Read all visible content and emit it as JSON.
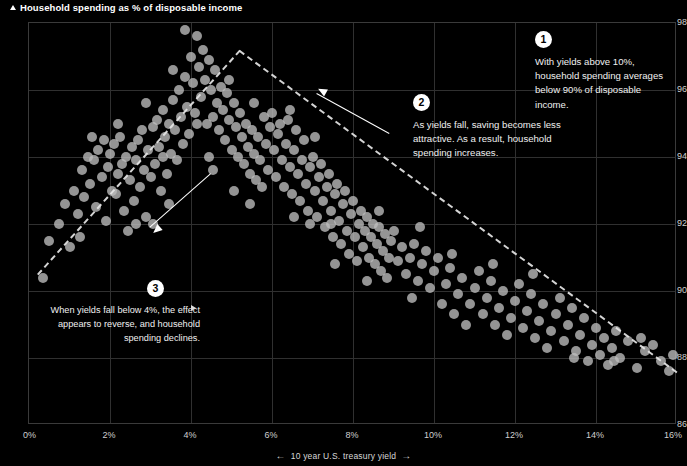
{
  "title": {
    "text": "Household spending as % of disposable income",
    "marker_icon": "up-arrow-icon"
  },
  "axis": {
    "y": {
      "label": "Household spending as % of disposable income",
      "ticks": [
        "98",
        "96",
        "94",
        "92",
        "90",
        "88",
        "86"
      ],
      "min": 86,
      "max": 98,
      "step": 2
    },
    "x": {
      "label": "10 year U.S. treasury yield",
      "ticks": [
        "0%",
        "2%",
        "4%",
        "6%",
        "8%",
        "10%",
        "12%",
        "14%",
        "16%"
      ],
      "min": 0,
      "max": 16,
      "step": 2,
      "left_arrow": "←",
      "right_arrow": "→"
    }
  },
  "annotations": [
    {
      "number": "1",
      "text": "With yields above 10%, household spending averages below 90% of disposable income."
    },
    {
      "number": "2",
      "text": "As yields fall, saving becomes less attractive. As a result, household spending increases."
    },
    {
      "number": "3",
      "text": "When yields fall below 4%, the effect appears to reverse, and household spending declines."
    }
  ],
  "colors": {
    "background": "#000000",
    "point": "#bebebe",
    "grid": "#303030",
    "text": "#e8e8e8",
    "accent": "#ffffff"
  },
  "chart_data": {
    "type": "scatter",
    "title": "Household spending as % of disposable income",
    "xlabel": "10 year U.S. treasury yield",
    "ylabel": "Household spending as % of disposable income",
    "xlim": [
      0,
      16
    ],
    "ylim": [
      86,
      98
    ],
    "xticks": [
      0,
      2,
      4,
      6,
      8,
      10,
      12,
      14,
      16
    ],
    "yticks": [
      86,
      88,
      90,
      92,
      94,
      96,
      98
    ],
    "grid": true,
    "legend": "none",
    "x_unit": "%",
    "y_unit": "%",
    "points": [
      [
        0.35,
        90.4
      ],
      [
        0.75,
        92.0
      ],
      [
        0.9,
        92.6
      ],
      [
        1.0,
        91.3
      ],
      [
        1.1,
        93.0
      ],
      [
        1.2,
        92.3
      ],
      [
        1.3,
        93.6
      ],
      [
        1.35,
        92.8
      ],
      [
        1.45,
        94.0
      ],
      [
        1.5,
        93.2
      ],
      [
        1.6,
        93.9
      ],
      [
        1.65,
        92.5
      ],
      [
        1.7,
        94.2
      ],
      [
        1.8,
        93.4
      ],
      [
        1.85,
        94.5
      ],
      [
        1.9,
        92.1
      ],
      [
        1.95,
        93.7
      ],
      [
        2.0,
        94.1
      ],
      [
        2.05,
        93.0
      ],
      [
        2.1,
        94.4
      ],
      [
        2.15,
        92.9
      ],
      [
        2.2,
        93.5
      ],
      [
        2.25,
        94.6
      ],
      [
        2.3,
        93.8
      ],
      [
        2.35,
        92.4
      ],
      [
        2.4,
        94.0
      ],
      [
        2.5,
        93.3
      ],
      [
        2.55,
        94.3
      ],
      [
        2.6,
        92.7
      ],
      [
        2.65,
        93.9
      ],
      [
        2.7,
        94.5
      ],
      [
        2.75,
        93.1
      ],
      [
        2.8,
        94.8
      ],
      [
        2.85,
        93.6
      ],
      [
        2.9,
        92.2
      ],
      [
        2.95,
        94.2
      ],
      [
        3.0,
        93.4
      ],
      [
        3.05,
        94.9
      ],
      [
        3.1,
        93.8
      ],
      [
        3.15,
        95.1
      ],
      [
        3.2,
        94.3
      ],
      [
        3.25,
        93.0
      ],
      [
        3.3,
        95.4
      ],
      [
        3.35,
        94.6
      ],
      [
        3.4,
        93.5
      ],
      [
        3.45,
        95.0
      ],
      [
        3.5,
        94.1
      ],
      [
        3.55,
        95.7
      ],
      [
        3.6,
        94.8
      ],
      [
        3.65,
        93.9
      ],
      [
        3.7,
        96.0
      ],
      [
        3.75,
        95.2
      ],
      [
        3.8,
        94.4
      ],
      [
        3.85,
        96.4
      ],
      [
        3.9,
        95.5
      ],
      [
        3.95,
        94.7
      ],
      [
        4.0,
        97.0
      ],
      [
        4.05,
        96.2
      ],
      [
        4.1,
        95.3
      ],
      [
        4.15,
        97.6
      ],
      [
        4.2,
        96.7
      ],
      [
        4.25,
        95.8
      ],
      [
        4.3,
        97.2
      ],
      [
        4.35,
        96.3
      ],
      [
        4.4,
        95.0
      ],
      [
        4.45,
        96.9
      ],
      [
        4.5,
        96.0
      ],
      [
        4.55,
        95.2
      ],
      [
        4.6,
        96.6
      ],
      [
        4.65,
        95.6
      ],
      [
        4.7,
        94.8
      ],
      [
        4.75,
        96.1
      ],
      [
        4.8,
        95.4
      ],
      [
        4.85,
        94.5
      ],
      [
        4.9,
        95.9
      ],
      [
        4.95,
        95.1
      ],
      [
        5.0,
        94.2
      ],
      [
        5.05,
        95.6
      ],
      [
        5.1,
        94.9
      ],
      [
        5.15,
        94.0
      ],
      [
        5.2,
        95.3
      ],
      [
        5.25,
        94.6
      ],
      [
        5.3,
        93.8
      ],
      [
        5.35,
        95.0
      ],
      [
        5.4,
        94.3
      ],
      [
        5.45,
        93.5
      ],
      [
        5.5,
        94.8
      ],
      [
        5.55,
        94.1
      ],
      [
        5.6,
        93.3
      ],
      [
        5.65,
        94.6
      ],
      [
        5.7,
        93.9
      ],
      [
        5.75,
        93.1
      ],
      [
        5.8,
        95.2
      ],
      [
        5.85,
        94.4
      ],
      [
        5.9,
        93.6
      ],
      [
        5.95,
        94.9
      ],
      [
        6.0,
        95.3
      ],
      [
        6.05,
        94.2
      ],
      [
        6.1,
        93.4
      ],
      [
        6.15,
        94.7
      ],
      [
        6.2,
        95.0
      ],
      [
        6.25,
        93.9
      ],
      [
        6.3,
        93.1
      ],
      [
        6.35,
        94.4
      ],
      [
        6.4,
        95.1
      ],
      [
        6.45,
        93.7
      ],
      [
        6.5,
        92.9
      ],
      [
        6.55,
        94.2
      ],
      [
        6.6,
        94.8
      ],
      [
        6.65,
        93.5
      ],
      [
        6.7,
        92.7
      ],
      [
        6.75,
        93.9
      ],
      [
        6.8,
        94.5
      ],
      [
        6.85,
        93.2
      ],
      [
        6.9,
        92.4
      ],
      [
        6.95,
        93.7
      ],
      [
        7.0,
        94.0
      ],
      [
        7.05,
        93.0
      ],
      [
        7.1,
        92.2
      ],
      [
        7.15,
        93.4
      ],
      [
        7.2,
        93.8
      ],
      [
        7.25,
        92.7
      ],
      [
        7.3,
        91.9
      ],
      [
        7.35,
        93.1
      ],
      [
        7.4,
        93.5
      ],
      [
        7.45,
        92.4
      ],
      [
        7.5,
        91.6
      ],
      [
        7.55,
        92.9
      ],
      [
        7.6,
        93.2
      ],
      [
        7.65,
        92.1
      ],
      [
        7.7,
        91.4
      ],
      [
        7.75,
        92.6
      ],
      [
        7.8,
        93.0
      ],
      [
        7.85,
        91.8
      ],
      [
        7.9,
        91.1
      ],
      [
        7.95,
        92.3
      ],
      [
        8.0,
        92.7
      ],
      [
        8.05,
        91.6
      ],
      [
        8.1,
        90.9
      ],
      [
        8.15,
        92.0
      ],
      [
        8.2,
        92.4
      ],
      [
        8.25,
        91.3
      ],
      [
        8.3,
        91.8
      ],
      [
        8.35,
        92.2
      ],
      [
        8.4,
        91.0
      ],
      [
        8.45,
        91.6
      ],
      [
        8.5,
        92.0
      ],
      [
        8.55,
        90.8
      ],
      [
        8.6,
        91.4
      ],
      [
        8.65,
        91.9
      ],
      [
        8.7,
        90.6
      ],
      [
        8.75,
        91.2
      ],
      [
        8.8,
        91.7
      ],
      [
        8.85,
        90.4
      ],
      [
        8.9,
        91.0
      ],
      [
        8.95,
        91.5
      ],
      [
        9.0,
        91.8
      ],
      [
        9.1,
        90.9
      ],
      [
        9.2,
        91.3
      ],
      [
        9.3,
        90.5
      ],
      [
        9.4,
        91.0
      ],
      [
        9.5,
        91.4
      ],
      [
        9.6,
        90.3
      ],
      [
        9.7,
        90.8
      ],
      [
        9.8,
        91.2
      ],
      [
        9.9,
        90.1
      ],
      [
        10.0,
        90.6
      ],
      [
        10.1,
        91.0
      ],
      [
        10.2,
        89.6
      ],
      [
        10.3,
        90.2
      ],
      [
        10.4,
        90.7
      ],
      [
        10.5,
        89.3
      ],
      [
        10.6,
        89.9
      ],
      [
        10.7,
        90.4
      ],
      [
        10.8,
        89.0
      ],
      [
        10.9,
        89.6
      ],
      [
        11.0,
        90.1
      ],
      [
        11.1,
        90.6
      ],
      [
        11.2,
        89.3
      ],
      [
        11.3,
        89.8
      ],
      [
        11.4,
        90.3
      ],
      [
        11.5,
        89.0
      ],
      [
        11.6,
        89.5
      ],
      [
        11.7,
        90.0
      ],
      [
        11.8,
        88.7
      ],
      [
        11.9,
        89.2
      ],
      [
        12.0,
        89.7
      ],
      [
        12.1,
        90.2
      ],
      [
        12.2,
        88.9
      ],
      [
        12.3,
        89.4
      ],
      [
        12.4,
        89.9
      ],
      [
        12.5,
        88.6
      ],
      [
        12.6,
        89.1
      ],
      [
        12.7,
        89.6
      ],
      [
        12.8,
        88.3
      ],
      [
        12.9,
        88.8
      ],
      [
        13.0,
        89.3
      ],
      [
        13.1,
        89.8
      ],
      [
        13.2,
        88.5
      ],
      [
        13.3,
        89.0
      ],
      [
        13.4,
        89.5
      ],
      [
        13.5,
        88.2
      ],
      [
        13.6,
        88.7
      ],
      [
        13.7,
        89.2
      ],
      [
        13.8,
        87.9
      ],
      [
        13.9,
        88.4
      ],
      [
        14.0,
        88.9
      ],
      [
        14.1,
        88.1
      ],
      [
        14.2,
        88.6
      ],
      [
        14.3,
        87.8
      ],
      [
        14.4,
        88.3
      ],
      [
        14.5,
        88.8
      ],
      [
        14.6,
        88.0
      ],
      [
        14.8,
        88.5
      ],
      [
        15.0,
        87.7
      ],
      [
        15.2,
        88.2
      ],
      [
        15.4,
        88.4
      ],
      [
        15.6,
        87.9
      ],
      [
        15.8,
        87.6
      ],
      [
        15.9,
        88.1
      ],
      [
        0.5,
        91.5
      ],
      [
        2.45,
        91.8
      ],
      [
        3.05,
        92.0
      ],
      [
        4.45,
        94.0
      ],
      [
        5.05,
        93.0
      ],
      [
        1.25,
        91.6
      ],
      [
        2.9,
        95.6
      ],
      [
        3.55,
        96.6
      ],
      [
        3.85,
        97.8
      ],
      [
        4.15,
        95.0
      ],
      [
        4.95,
        96.3
      ],
      [
        5.55,
        95.6
      ],
      [
        6.45,
        95.4
      ],
      [
        7.05,
        94.6
      ],
      [
        2.2,
        95.0
      ],
      [
        3.3,
        94.0
      ],
      [
        6.95,
        92.0
      ],
      [
        7.45,
        92.0
      ],
      [
        8.35,
        90.3
      ],
      [
        9.45,
        89.8
      ],
      [
        10.45,
        91.1
      ],
      [
        11.45,
        90.8
      ],
      [
        12.45,
        90.5
      ],
      [
        1.55,
        94.6
      ],
      [
        2.65,
        92.0
      ],
      [
        3.45,
        92.6
      ],
      [
        4.55,
        93.6
      ],
      [
        5.45,
        92.6
      ],
      [
        6.55,
        92.2
      ],
      [
        7.55,
        90.8
      ],
      [
        8.65,
        92.4
      ],
      [
        9.65,
        91.9
      ],
      [
        13.45,
        88.0
      ],
      [
        14.45,
        87.9
      ],
      [
        15.1,
        88.6
      ]
    ],
    "trend_lines": [
      {
        "id": "left-rising",
        "x0": 0.2,
        "y0": 90.5,
        "x1": 5.2,
        "y1": 97.2,
        "style": "dashed",
        "note": "rising segment at low yields"
      },
      {
        "id": "right-falling",
        "x0": 5.2,
        "y0": 97.2,
        "x1": 16.0,
        "y1": 87.6,
        "style": "dashed",
        "note": "falling segment as yields rise"
      }
    ],
    "callout_arrows": [
      {
        "id": "arrow-to-low-yield",
        "from_x": 4.5,
        "from_y": 93.5,
        "to_x": 3.0,
        "to_y": 91.9
      },
      {
        "id": "arrow-to-peak",
        "from_x": 8.9,
        "from_y": 94.7,
        "to_x": 7.1,
        "to_y": 95.9
      }
    ]
  }
}
